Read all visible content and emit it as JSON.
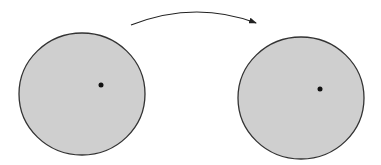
{
  "diagram": {
    "background": "#ffffff",
    "arrow": {
      "color": "#222222",
      "direction": "left-to-right",
      "path": "M131,25 Q195,0 256,23"
    },
    "discs": [
      {
        "id": "left",
        "cx": 82,
        "cy": 94,
        "rx": 63,
        "ry": 61,
        "fill": "#cfcfcf",
        "stroke": "#333333",
        "point": {
          "x": 101,
          "y": 85,
          "r": 2.5,
          "color": "#111111"
        }
      },
      {
        "id": "right",
        "cx": 301,
        "cy": 98,
        "rx": 63,
        "ry": 61,
        "fill": "#cfcfcf",
        "stroke": "#333333",
        "point": {
          "x": 320,
          "y": 89,
          "r": 2.5,
          "color": "#111111"
        }
      }
    ]
  }
}
